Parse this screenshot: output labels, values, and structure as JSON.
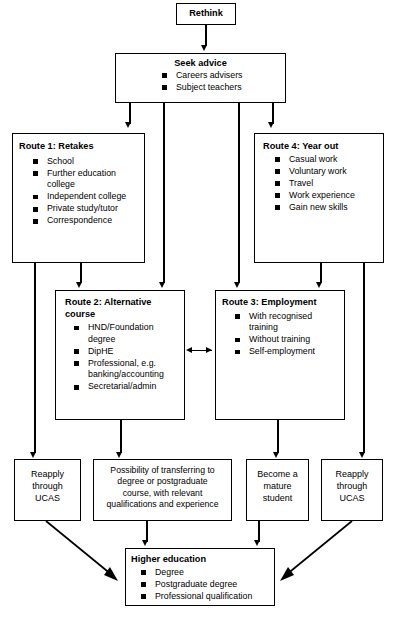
{
  "diagram": {
    "title_box": {
      "label": "Rethink"
    },
    "seek_advice": {
      "title": "Seek advice",
      "items": [
        "Careers advisers",
        "Subject teachers"
      ]
    },
    "route1": {
      "title": "Route 1: Retakes",
      "items": [
        "School",
        "Further education college",
        "Independent college",
        "Private study/tutor",
        "Correspondence"
      ]
    },
    "route4": {
      "title": "Route 4: Year out",
      "items": [
        "Casual work",
        "Voluntary work",
        "Travel",
        "Work experience",
        "Gain new skills"
      ]
    },
    "route2": {
      "title": "Route 2: Alternative\ncourse",
      "items": [
        "HND/Foundation degree",
        "DipHE",
        "Professional, e.g. banking/accounting",
        "Secretarial/admin"
      ]
    },
    "route3": {
      "title": "Route 3: Employment",
      "items": [
        "With recognised training",
        "Without training",
        "Self-employment"
      ]
    },
    "reapply_left": {
      "label": "Reapply\nthrough\nUCAS"
    },
    "transfer": {
      "label": "Possibility of transferring to\ndegree or postgraduate\ncourse, with relevant\nqualifications and experience"
    },
    "mature": {
      "label": "Become a\nmature\nstudent"
    },
    "reapply_right": {
      "label": "Reapply\nthrough\nUCAS"
    },
    "higher_education": {
      "title": "Higher education",
      "items": [
        "Degree",
        "Postgraduate degree",
        "Professional qualification"
      ]
    },
    "colors": {
      "stroke": "#000000",
      "background": "#ffffff",
      "text": "#000000"
    }
  }
}
